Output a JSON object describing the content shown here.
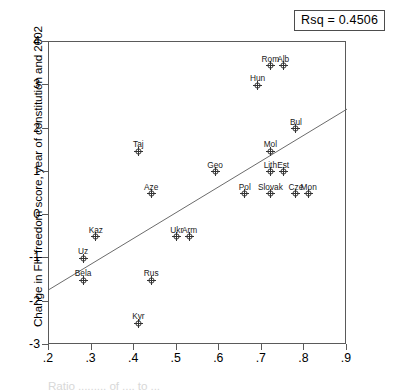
{
  "annotation": {
    "rsq_label": "Rsq = 0.4506"
  },
  "axes": {
    "y_title": "Change in FH freedom score, year of constitution and 2002",
    "x_title": "Ratio ......... of .... to ...",
    "y_ticks": [
      "4",
      "3",
      "2",
      "1",
      "0",
      "-1",
      "-2",
      "-3"
    ],
    "x_ticks": [
      ".2",
      ".3",
      ".4",
      ".5",
      ".6",
      ".7",
      ".8",
      ".9"
    ]
  },
  "chart_data": {
    "type": "scatter",
    "title": "",
    "xlabel": "",
    "ylabel": "Change in FH freedom score, year of constitution and 2002",
    "xlim": [
      0.2,
      0.9
    ],
    "ylim": [
      -3,
      4
    ],
    "grid": false,
    "legend": null,
    "annotations": [
      {
        "text": "Rsq = 0.4506",
        "type": "r_squared",
        "value": 0.4506
      }
    ],
    "xticks": [
      0.2,
      0.3,
      0.4,
      0.5,
      0.6,
      0.7,
      0.8,
      0.9
    ],
    "xticklabels": [
      ".2",
      ".3",
      ".4",
      ".5",
      ".6",
      ".7",
      ".8",
      ".9"
    ],
    "yticks": [
      -3,
      -2,
      -1,
      0,
      1,
      2,
      3,
      4
    ],
    "yticklabels": [
      "-3",
      "-2",
      "-1",
      "0",
      "1",
      "2",
      "3",
      "4"
    ],
    "trendline": {
      "type": "linear_fit",
      "x_start": 0.2,
      "y_start": -1.72,
      "x_end": 0.9,
      "y_end": 2.45
    },
    "points": [
      {
        "label": "Rom",
        "x": 0.72,
        "y": 3.45,
        "label_dx": 0,
        "label_dy": -11
      },
      {
        "label": "Alb",
        "x": 0.75,
        "y": 3.45,
        "label_dx": 0,
        "label_dy": -11
      },
      {
        "label": "Hun",
        "x": 0.69,
        "y": 3.0,
        "label_dx": 0,
        "label_dy": -11
      },
      {
        "label": "Bul",
        "x": 0.78,
        "y": 2.0,
        "label_dx": 0,
        "label_dy": -11
      },
      {
        "label": "Mol",
        "x": 0.72,
        "y": 1.48,
        "label_dx": 0,
        "label_dy": -11
      },
      {
        "label": "Taj",
        "x": 0.41,
        "y": 1.48,
        "label_dx": 0,
        "label_dy": -11
      },
      {
        "label": "Geo",
        "x": 0.59,
        "y": 1.0,
        "label_dx": 0,
        "label_dy": -11
      },
      {
        "label": "Lith",
        "x": 0.72,
        "y": 1.0,
        "label_dx": 0,
        "label_dy": -11
      },
      {
        "label": "Est",
        "x": 0.75,
        "y": 1.0,
        "label_dx": 0,
        "label_dy": -11
      },
      {
        "label": "Aze",
        "x": 0.44,
        "y": 0.5,
        "label_dx": 0,
        "label_dy": -11
      },
      {
        "label": "Pol",
        "x": 0.66,
        "y": 0.5,
        "label_dx": 0,
        "label_dy": -11
      },
      {
        "label": "Slovak",
        "x": 0.72,
        "y": 0.5,
        "label_dx": 0,
        "label_dy": -11
      },
      {
        "label": "Cze",
        "x": 0.78,
        "y": 0.5,
        "label_dx": 0,
        "label_dy": -11
      },
      {
        "label": "Mon",
        "x": 0.81,
        "y": 0.5,
        "label_dx": 0,
        "label_dy": -11
      },
      {
        "label": "Kaz",
        "x": 0.31,
        "y": -0.5,
        "label_dx": 0,
        "label_dy": -11
      },
      {
        "label": "Ukr",
        "x": 0.5,
        "y": -0.5,
        "label_dx": 0,
        "label_dy": -11
      },
      {
        "label": "Arm",
        "x": 0.53,
        "y": -0.5,
        "label_dx": 0,
        "label_dy": -11
      },
      {
        "label": "Uz",
        "x": 0.28,
        "y": -1.0,
        "label_dx": 0,
        "label_dy": -11
      },
      {
        "label": "Bela",
        "x": 0.28,
        "y": -1.5,
        "label_dx": 0,
        "label_dy": -11
      },
      {
        "label": "Rus",
        "x": 0.44,
        "y": -1.5,
        "label_dx": 0,
        "label_dy": -11
      },
      {
        "label": "Kyr",
        "x": 0.41,
        "y": -2.5,
        "label_dx": 0,
        "label_dy": -11
      }
    ]
  }
}
